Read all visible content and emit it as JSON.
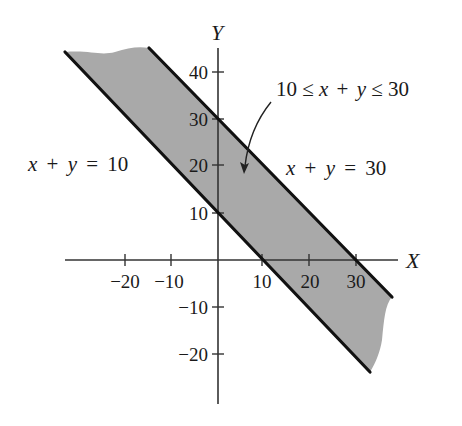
{
  "figure": {
    "axes": {
      "x_label": "X",
      "y_label": "Y",
      "x_ticks": [
        {
          "value": -20,
          "label": "−20"
        },
        {
          "value": -10,
          "label": "−10"
        },
        {
          "value": 10,
          "label": "10"
        },
        {
          "value": 20,
          "label": "20"
        },
        {
          "value": 30,
          "label": "30"
        }
      ],
      "y_ticks": [
        {
          "value": 40,
          "label": "40"
        },
        {
          "value": 30,
          "label": "30"
        },
        {
          "value": 20,
          "label": "20"
        },
        {
          "value": 10,
          "label": "10"
        },
        {
          "value": -10,
          "label": "−10"
        },
        {
          "value": -20,
          "label": "−20"
        }
      ]
    },
    "lines": [
      {
        "equation": "x + y = 10",
        "parts": {
          "x": "x",
          "plus": "+",
          "y": "y",
          "eq": "=",
          "c": "10"
        }
      },
      {
        "equation": "x + y = 30",
        "parts": {
          "x": "x",
          "plus": "+",
          "y": "y",
          "eq": "=",
          "c": "30"
        }
      }
    ],
    "region": {
      "label": "10 ≤ x + y ≤ 30",
      "parts": {
        "lo": "10",
        "le1": "≤",
        "x": "x",
        "plus": "+",
        "y": "y",
        "le2": "≤",
        "hi": "30"
      },
      "fill_color": "#a9a9a9"
    },
    "colors": {
      "line": "#111111",
      "axis": "#333333",
      "shade": "#a9a9a9"
    }
  }
}
